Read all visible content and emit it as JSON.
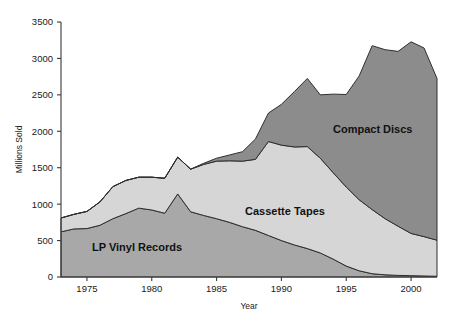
{
  "chart_data": {
    "type": "area",
    "stacked": true,
    "title": "",
    "xlabel": "Year",
    "ylabel": "Millions Sold",
    "xlim": [
      1973,
      2002
    ],
    "ylim": [
      0,
      3500
    ],
    "xticks": [
      1975,
      1980,
      1985,
      1990,
      1995,
      2000
    ],
    "yticks": [
      0,
      500,
      1000,
      1500,
      2000,
      2500,
      3000,
      3500
    ],
    "grid": false,
    "legend": "inline-annotations",
    "x": [
      1973,
      1974,
      1975,
      1976,
      1977,
      1978,
      1979,
      1980,
      1981,
      1982,
      1983,
      1984,
      1985,
      1986,
      1987,
      1988,
      1989,
      1990,
      1991,
      1992,
      1993,
      1994,
      1995,
      1996,
      1997,
      1998,
      1999,
      2000,
      2001,
      2002
    ],
    "series": [
      {
        "name": "LP Vinyl Records",
        "color": "#a8a8a8",
        "values": [
          620,
          660,
          665,
          710,
          800,
          870,
          945,
          920,
          875,
          1140,
          895,
          845,
          800,
          750,
          690,
          640,
          570,
          500,
          440,
          390,
          330,
          245,
          150,
          85,
          45,
          30,
          22,
          18,
          14,
          10
        ]
      },
      {
        "name": "Cassette Tapes",
        "color": "#d6d6d6",
        "values": [
          190,
          200,
          235,
          320,
          440,
          455,
          425,
          450,
          480,
          505,
          585,
          700,
          790,
          845,
          900,
          975,
          1290,
          1310,
          1345,
          1400,
          1300,
          1185,
          1085,
          975,
          880,
          770,
          675,
          580,
          540,
          495
        ]
      },
      {
        "name": "Compact Discs",
        "color": "#8c8c8c",
        "values": [
          0,
          0,
          0,
          0,
          0,
          0,
          0,
          0,
          0,
          0,
          0,
          15,
          40,
          80,
          130,
          280,
          390,
          560,
          760,
          935,
          870,
          1080,
          1270,
          1700,
          2250,
          2320,
          2400,
          2630,
          2590,
          2220
        ]
      }
    ],
    "annotations": [
      {
        "name": "lp-vinyl-records-label",
        "text": "LP Vinyl Records",
        "x_px": 92,
        "y_px": 251
      },
      {
        "name": "cassette-tapes-label",
        "text": "Cassette Tapes",
        "x_px": 245,
        "y_px": 215
      },
      {
        "name": "compact-discs-label",
        "text": "Compact Discs",
        "x_px": 333,
        "y_px": 133
      }
    ],
    "plot_box_px": {
      "left": 61,
      "right": 437,
      "top": 22,
      "bottom": 277
    }
  },
  "axes": {
    "y_title": "Millions Sold",
    "x_title": "Year",
    "y_tick_labels": [
      "0",
      "500",
      "1000",
      "1500",
      "2000",
      "2500",
      "3000",
      "3500"
    ],
    "x_tick_labels": [
      "1975",
      "1980",
      "1985",
      "1990",
      "1995",
      "2000"
    ]
  },
  "colors": {
    "background": "#ffffff",
    "axis": "#3a3a3a",
    "text": "#1a1a1a",
    "lp": "#a8a8a8",
    "cassette": "#d6d6d6",
    "cd": "#8c8c8c"
  }
}
